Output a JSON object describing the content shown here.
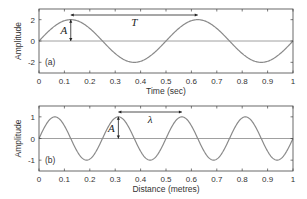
{
  "chart_data": [
    {
      "type": "line",
      "panel_label": "(a)",
      "title": "",
      "xlabel": "Time (sec)",
      "ylabel": "Amplitude",
      "xlim": [
        0,
        1
      ],
      "ylim": [
        -3,
        3
      ],
      "xticks": [
        "0",
        "0.1",
        "0.2",
        "0.3",
        "0.4",
        "0.5",
        "0.6",
        "0.7",
        "0.8",
        "0.9",
        "1"
      ],
      "yticks": [
        "2",
        "0",
        "-2"
      ],
      "series": [
        {
          "name": "sine wave",
          "function": "2*sin(2*pi*t/0.5)",
          "amplitude": 2,
          "period": 0.5,
          "x": [
            0,
            0.125,
            0.25,
            0.375,
            0.5,
            0.625,
            0.75,
            0.875,
            1.0
          ],
          "values": [
            0,
            2,
            0,
            -2,
            0,
            2,
            0,
            -2,
            0
          ]
        }
      ],
      "annotations": [
        {
          "symbol": "A",
          "meaning": "amplitude arrow at t=0.125 from 0 to 2"
        },
        {
          "symbol": "T",
          "meaning": "period arrow from t=0.125 to t=0.625"
        }
      ],
      "grid": false
    },
    {
      "type": "line",
      "panel_label": "(b)",
      "title": "",
      "xlabel": "Distance (metres)",
      "ylabel": "Amplitude",
      "xlim": [
        0,
        1
      ],
      "ylim": [
        -1.5,
        1.5
      ],
      "xticks": [
        "0",
        "0.1",
        "0.2",
        "0.3",
        "0.4",
        "0.5",
        "0.6",
        "0.7",
        "0.8",
        "0.9",
        "1"
      ],
      "yticks": [
        "1",
        "0",
        "-1"
      ],
      "series": [
        {
          "name": "sine wave",
          "function": "sin(2*pi*x/0.25)",
          "amplitude": 1,
          "wavelength": 0.25,
          "x": [
            0,
            0.0625,
            0.125,
            0.1875,
            0.25,
            0.3125,
            0.375,
            0.4375,
            0.5,
            0.5625,
            0.625,
            0.6875,
            0.75,
            0.8125,
            0.875,
            0.9375,
            1.0
          ],
          "values": [
            0,
            1,
            0,
            -1,
            0,
            1,
            0,
            -1,
            0,
            1,
            0,
            -1,
            0,
            1,
            0,
            -1,
            0
          ]
        }
      ],
      "annotations": [
        {
          "symbol": "A",
          "meaning": "amplitude arrow at x=0.3125 from 0 to 1"
        },
        {
          "symbol": "λ",
          "meaning": "wavelength arrow from x=0.3125 to x=0.5625"
        }
      ],
      "grid": false
    }
  ],
  "labels": {
    "top_panel": "(a)",
    "bottom_panel": "(b)",
    "top_xlabel": "Time (sec)",
    "bottom_xlabel": "Distance (metres)",
    "ylabel": "Amplitude",
    "amp_symbol": "A",
    "period_symbol": "T",
    "wavelength_symbol": "λ"
  },
  "colors": {
    "curve": "#8a8a8a",
    "axis": "#444444",
    "zero_line": "#a0a0a0",
    "arrow": "#222222"
  }
}
